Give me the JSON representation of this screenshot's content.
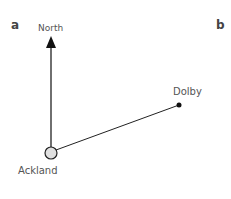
{
  "panels": {
    "left_label": "a",
    "right_label": "b"
  },
  "compass": {
    "label": "North"
  },
  "places": {
    "origin": {
      "name": "Ackland"
    },
    "destination": {
      "name": "Dolby"
    }
  },
  "colors": {
    "line": "#222222",
    "origin_fill": "#e0e0e0",
    "text": "#555555"
  }
}
